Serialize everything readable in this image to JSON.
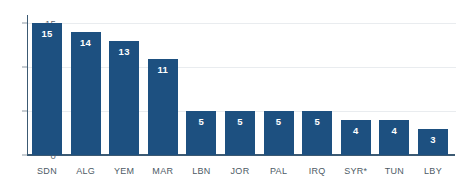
{
  "chart_data": {
    "type": "bar",
    "title": "",
    "subtitle": "",
    "xlabel": "",
    "ylabel": "",
    "categories": [
      "SDN",
      "ALG",
      "YEM",
      "MAR",
      "LBN",
      "JOR",
      "PAL",
      "IRQ",
      "SYR*",
      "TUN",
      "LBY"
    ],
    "values": [
      15,
      14,
      13,
      11,
      5,
      5,
      5,
      5,
      4,
      4,
      3
    ],
    "data_labels": [
      "15",
      "14",
      "13",
      "11",
      "5",
      "5",
      "5",
      "5",
      "4",
      "4",
      "3"
    ],
    "ylim": [
      0,
      16.3
    ],
    "yticks": [
      0,
      5,
      10,
      15
    ],
    "ytick_labels": [
      "0",
      "5",
      "10",
      "15"
    ],
    "grid": true,
    "grid_axis": "y",
    "legend": false,
    "legend_position": "none",
    "bar_color": "#1d5080",
    "data_label_color": "#ffffff",
    "gridline_color": "#e9ecef",
    "axis_line_color": "#3c5a73",
    "tick_label_color": "#5a6670",
    "category_label_color": "#4d5b66",
    "background_color": "#ffffff",
    "annotations": [
      "* asterisk on SYR category label"
    ]
  }
}
